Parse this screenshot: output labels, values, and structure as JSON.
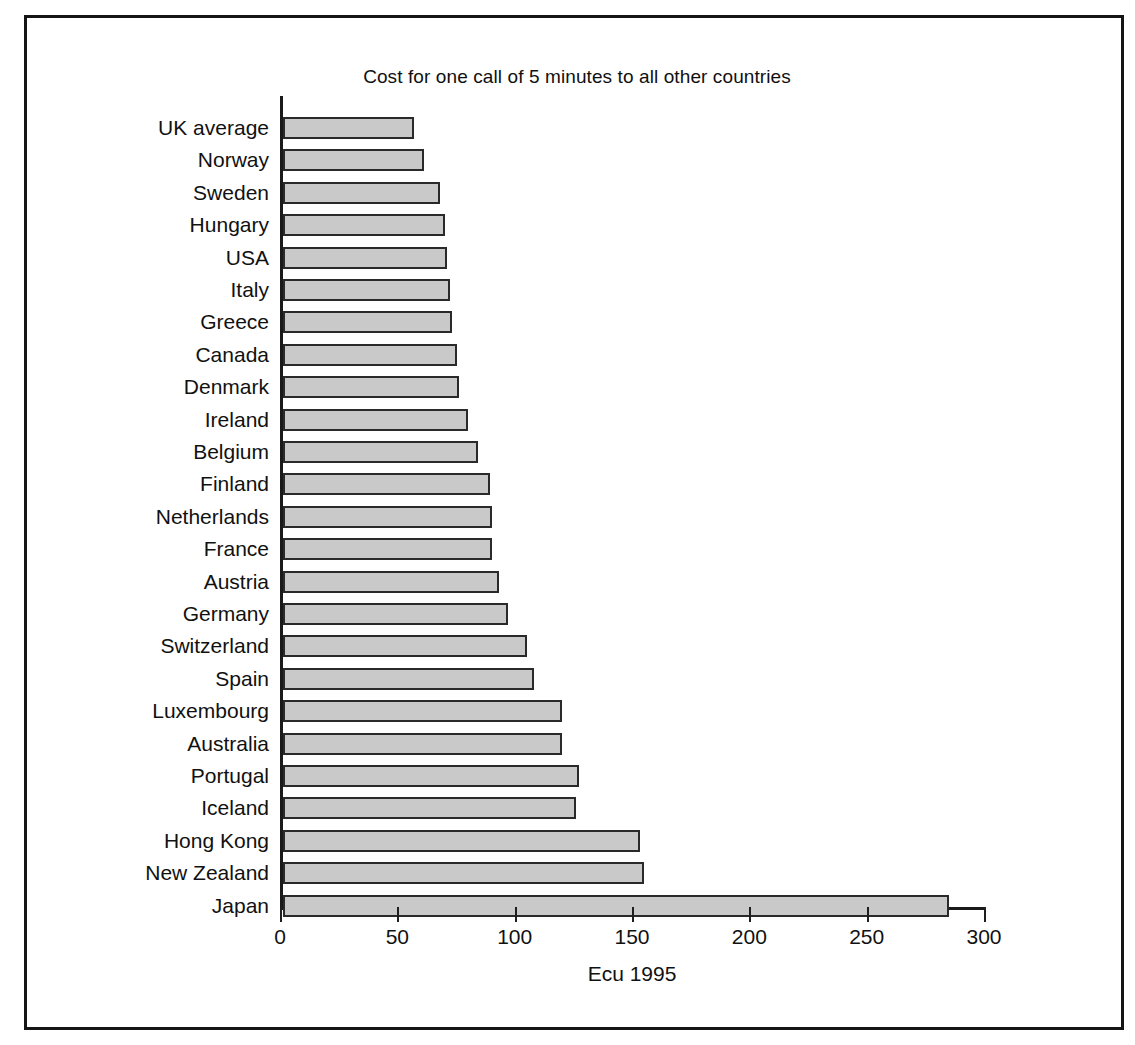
{
  "figure": {
    "frame_color": "#151515",
    "background": "#ffffff"
  },
  "chart_data": {
    "type": "bar",
    "orientation": "horizontal",
    "title": "Cost for one call of 5 minutes to all other countries",
    "xlabel": "Ecu 1995",
    "ylabel": "",
    "xlim": [
      0,
      300
    ],
    "xticks": [
      0,
      50,
      100,
      150,
      200,
      250,
      300
    ],
    "xtick_labels": [
      "0",
      "50",
      "100",
      "150",
      "200",
      "250",
      "300"
    ],
    "grid": false,
    "legend": null,
    "bar_fill_color": "#c9c9c9",
    "bar_edge_color": "#2a2a2a",
    "categories": [
      "UK average",
      "Norway",
      "Sweden",
      "Hungary",
      "USA",
      "Italy",
      "Greece",
      "Canada",
      "Denmark",
      "Ireland",
      "Belgium",
      "Finland",
      "Netherlands",
      "France",
      "Austria",
      "Germany",
      "Switzerland",
      "Spain",
      "Luxembourg",
      "Australia",
      "Portugal",
      "Iceland",
      "Hong Kong",
      "New Zealand",
      "Japan"
    ],
    "values": [
      56,
      60,
      67,
      69,
      70,
      71,
      72,
      74,
      75,
      79,
      83,
      88,
      89,
      89,
      92,
      96,
      104,
      107,
      119,
      119,
      126,
      125,
      152,
      154,
      284
    ]
  }
}
